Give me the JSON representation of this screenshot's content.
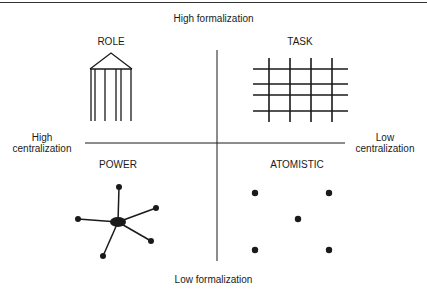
{
  "axes": {
    "vertical_top": "High formalization",
    "vertical_bottom": "Low formalization",
    "horizontal_left": [
      "High",
      "centralization"
    ],
    "horizontal_right": [
      "Low",
      "centralization"
    ]
  },
  "quadrants": [
    {
      "position": "top-left",
      "title": "ROLE",
      "icon": "temple-columns-icon"
    },
    {
      "position": "top-right",
      "title": "TASK",
      "icon": "grid-icon"
    },
    {
      "position": "bottom-left",
      "title": "POWER",
      "icon": "hub-spoke-icon"
    },
    {
      "position": "bottom-right",
      "title": "ATOMISTIC",
      "icon": "scattered-dots-icon"
    }
  ],
  "colors": {
    "ink": "#1a1a1a",
    "background": "#ffffff"
  }
}
